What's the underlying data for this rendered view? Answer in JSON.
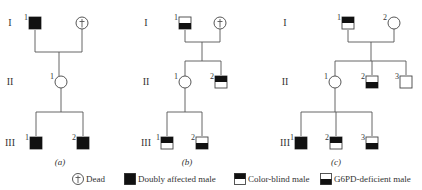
{
  "colors": {
    "fill": "#111111",
    "line": "#555555",
    "text": "#333333",
    "background": "#ffffff"
  },
  "generation_labels": [
    "I",
    "II",
    "III"
  ],
  "pedigrees": [
    {
      "caption": "(a)",
      "gen_label_x": 10,
      "individuals": [
        {
          "id": "I-1",
          "label": "1",
          "sex": "male",
          "status": "doubly-affected",
          "x": 35,
          "y": 23
        },
        {
          "id": "I-2",
          "label": "",
          "sex": "female",
          "status": "dead",
          "x": 82,
          "y": 23
        },
        {
          "id": "II-1",
          "label": "1",
          "sex": "female",
          "status": "unaffected",
          "x": 61,
          "y": 82
        },
        {
          "id": "III-1",
          "label": "1",
          "sex": "male",
          "status": "doubly-affected",
          "x": 36,
          "y": 143
        },
        {
          "id": "III-2",
          "label": "2",
          "sex": "male",
          "status": "doubly-affected",
          "x": 83,
          "y": 143
        }
      ],
      "lines": [
        [
          35,
          30,
          35,
          52
        ],
        [
          82,
          29,
          82,
          52
        ],
        [
          35,
          52,
          82,
          52
        ],
        [
          59,
          52,
          59,
          76
        ],
        [
          61,
          88,
          61,
          112
        ],
        [
          36,
          112,
          83,
          112
        ],
        [
          36,
          112,
          36,
          136
        ],
        [
          83,
          112,
          83,
          136
        ]
      ],
      "caption_x": 60
    },
    {
      "caption": "(b)",
      "gen_label_x": 146,
      "individuals": [
        {
          "id": "I-1",
          "label": "1",
          "sex": "male",
          "status": "g6pd-deficient",
          "x": 185,
          "y": 23
        },
        {
          "id": "I-2",
          "label": "",
          "sex": "female",
          "status": "dead",
          "x": 220,
          "y": 23
        },
        {
          "id": "II-1",
          "label": "1",
          "sex": "female",
          "status": "unaffected",
          "x": 185,
          "y": 82
        },
        {
          "id": "II-2",
          "label": "2",
          "sex": "male",
          "status": "color-blind",
          "x": 221,
          "y": 82
        },
        {
          "id": "III-1",
          "label": "1",
          "sex": "male",
          "status": "color-blind",
          "x": 167,
          "y": 143
        },
        {
          "id": "III-2",
          "label": "2",
          "sex": "male",
          "status": "g6pd-deficient",
          "x": 202,
          "y": 143
        }
      ],
      "lines": [
        [
          185,
          30,
          185,
          42
        ],
        [
          220,
          29,
          220,
          42
        ],
        [
          185,
          42,
          220,
          42
        ],
        [
          202,
          42,
          202,
          61
        ],
        [
          185,
          61,
          221,
          61
        ],
        [
          185,
          61,
          185,
          76
        ],
        [
          221,
          61,
          221,
          75
        ],
        [
          185,
          88,
          185,
          112
        ],
        [
          167,
          112,
          202,
          112
        ],
        [
          167,
          112,
          167,
          136
        ],
        [
          202,
          112,
          202,
          136
        ]
      ],
      "caption_x": 187
    },
    {
      "caption": "(c)",
      "gen_label_x": 285,
      "individuals": [
        {
          "id": "I-1",
          "label": "1",
          "sex": "male",
          "status": "color-blind",
          "x": 348,
          "y": 23
        },
        {
          "id": "I-2",
          "label": "2",
          "sex": "female",
          "status": "unaffected",
          "x": 394,
          "y": 23
        },
        {
          "id": "II-1",
          "label": "1",
          "sex": "female",
          "status": "unaffected",
          "x": 335,
          "y": 82
        },
        {
          "id": "II-2",
          "label": "2",
          "sex": "male",
          "status": "g6pd-deficient",
          "x": 372,
          "y": 82
        },
        {
          "id": "III-1",
          "label": "1",
          "sex": "male",
          "status": "doubly-affected",
          "x": 301,
          "y": 143
        },
        {
          "id": "II-3",
          "label": "3",
          "sex": "male",
          "status": "unaffected",
          "x": 406,
          "y": 82
        },
        {
          "id": "III-2",
          "label": "2",
          "sex": "male",
          "status": "color-blind",
          "x": 336,
          "y": 143
        },
        {
          "id": "III-3",
          "label": "3",
          "sex": "male",
          "status": "g6pd-deficient",
          "x": 372,
          "y": 143
        }
      ],
      "lines": [
        [
          348,
          30,
          348,
          42
        ],
        [
          394,
          29,
          394,
          42
        ],
        [
          348,
          42,
          394,
          42
        ],
        [
          371,
          42,
          371,
          61
        ],
        [
          335,
          61,
          406,
          61
        ],
        [
          335,
          61,
          335,
          76
        ],
        [
          372,
          61,
          372,
          75
        ],
        [
          406,
          61,
          406,
          75
        ],
        [
          335,
          88,
          335,
          112
        ],
        [
          301,
          112,
          372,
          112
        ],
        [
          301,
          112,
          301,
          136
        ],
        [
          336,
          112,
          336,
          136
        ],
        [
          372,
          112,
          372,
          136
        ]
      ],
      "caption_x": 336
    }
  ],
  "legend": [
    {
      "symbol": "dead",
      "label": "Dead",
      "x": 78
    },
    {
      "symbol": "doubly-affected",
      "label": "Doubly affected male",
      "x": 130
    },
    {
      "symbol": "color-blind",
      "label": "Color-blind male",
      "x": 240
    },
    {
      "symbol": "g6pd-deficient",
      "label": "G6PD-deficient male",
      "x": 326
    }
  ]
}
